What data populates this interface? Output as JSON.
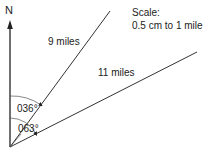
{
  "diagram": {
    "north_label": "N",
    "scale_title": "Scale:",
    "scale_value": "0.5 cm to 1 mile",
    "legs": [
      {
        "label": "9 miles",
        "bearing": "036°"
      },
      {
        "label": "11 miles",
        "bearing": "063°"
      }
    ],
    "line_color": "#333333"
  }
}
